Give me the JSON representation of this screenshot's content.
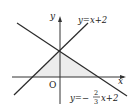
{
  "diagram": {
    "axes": {
      "x_label": "x",
      "y_label": "y",
      "origin_label": "O"
    },
    "lines": [
      {
        "name": "line1",
        "label": "y=x+2",
        "slope": 1,
        "intercept": 2
      },
      {
        "name": "line2",
        "label_prefix": "y=−",
        "frac_num": "2",
        "frac_den": "3",
        "label_suffix": "x+2",
        "slope": -0.6667,
        "intercept": 2
      }
    ],
    "shaded_region": {
      "vertices": [
        [
          -2,
          0
        ],
        [
          0,
          2
        ],
        [
          3,
          0
        ]
      ]
    },
    "colors": {
      "line": "#2a2a2a",
      "shade": "#eeeeee",
      "axis": "#333333"
    }
  }
}
